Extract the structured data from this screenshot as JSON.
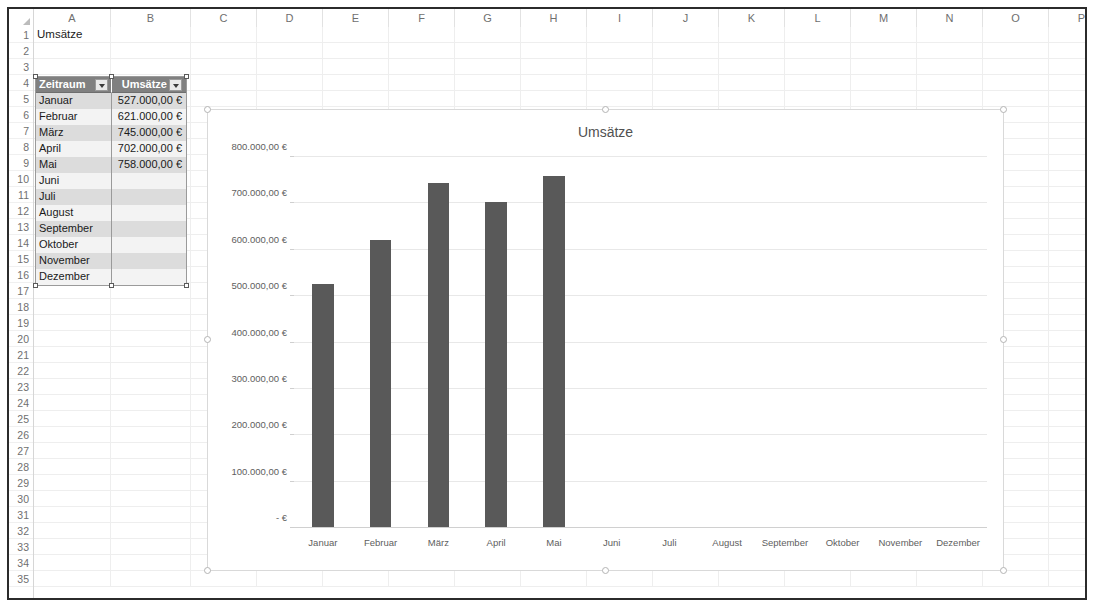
{
  "app": {
    "name": "spreadsheet-window"
  },
  "sheet": {
    "columns": [
      "A",
      "B",
      "C",
      "D",
      "E",
      "F",
      "G",
      "H",
      "I",
      "J",
      "K",
      "L",
      "M",
      "N",
      "O",
      "P"
    ],
    "column_widths": [
      77,
      80,
      66,
      66,
      66,
      66,
      66,
      66,
      66,
      66,
      66,
      66,
      66,
      66,
      66,
      66
    ],
    "rows": [
      1,
      2,
      3,
      4,
      5,
      6,
      7,
      8,
      9,
      10,
      11,
      12,
      13,
      14,
      15,
      16,
      17,
      18,
      19,
      20,
      21,
      22,
      23,
      24,
      25,
      26,
      27,
      28,
      29,
      30,
      31,
      32,
      33,
      34,
      35
    ],
    "a1_value": "Umsätze",
    "select_all_icon": "select-all-triangle-icon"
  },
  "table": {
    "headers": [
      "Zeitraum",
      "Umsätze"
    ],
    "filter_icon": "filter-dropdown-icon",
    "rows": [
      {
        "zeitraum": "Januar",
        "umsatz": "527.000,00 €"
      },
      {
        "zeitraum": "Februar",
        "umsatz": "621.000,00 €"
      },
      {
        "zeitraum": "März",
        "umsatz": "745.000,00 €"
      },
      {
        "zeitraum": "April",
        "umsatz": "702.000,00 €"
      },
      {
        "zeitraum": "Mai",
        "umsatz": "758.000,00 €"
      },
      {
        "zeitraum": "Juni",
        "umsatz": ""
      },
      {
        "zeitraum": "Juli",
        "umsatz": ""
      },
      {
        "zeitraum": "August",
        "umsatz": ""
      },
      {
        "zeitraum": "September",
        "umsatz": ""
      },
      {
        "zeitraum": "Oktober",
        "umsatz": ""
      },
      {
        "zeitraum": "November",
        "umsatz": ""
      },
      {
        "zeitraum": "Dezember",
        "umsatz": ""
      }
    ]
  },
  "chart_data": {
    "type": "bar",
    "title": "Umsätze",
    "xlabel": "",
    "ylabel": "",
    "categories": [
      "Januar",
      "Februar",
      "März",
      "April",
      "Mai",
      "Juni",
      "Juli",
      "August",
      "September",
      "Oktober",
      "November",
      "Dezember"
    ],
    "values": [
      527000,
      621000,
      745000,
      702000,
      758000,
      null,
      null,
      null,
      null,
      null,
      null,
      null
    ],
    "ylim": [
      0,
      800000
    ],
    "ytick_values": [
      0,
      100000,
      200000,
      300000,
      400000,
      500000,
      600000,
      700000,
      800000
    ],
    "ytick_labels": [
      "-   €",
      "100.000,00 €",
      "200.000,00 €",
      "300.000,00 €",
      "400.000,00 €",
      "500.000,00 €",
      "600.000,00 €",
      "700.000,00 €",
      "800.000,00 €"
    ],
    "grid": true,
    "legend": false,
    "series_color": "#595959",
    "gridline_color": "#e8e8e8",
    "text_color": "#5e5e5e",
    "selected": true
  },
  "colors": {
    "window_border": "#2b2b2b",
    "header_text": "#6f6f6f",
    "table_header_bg": "#808080",
    "band_odd": "#dcdcdc",
    "band_even": "#f3f3f3",
    "accent_bar": "#595959"
  }
}
